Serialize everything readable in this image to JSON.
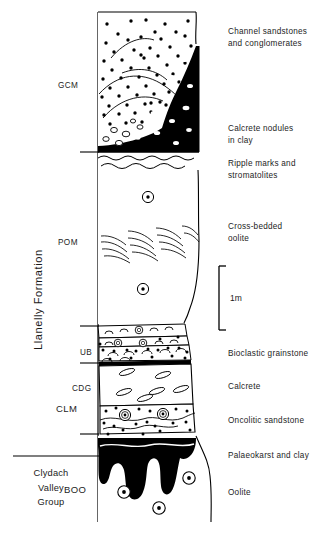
{
  "figure": {
    "type": "stratigraphic-column",
    "vertical_axis_label": "Llanelly Formation",
    "group_label": "Clydach\nValley\nGroup",
    "scale_bar": {
      "label": "1m",
      "top_y": 266,
      "bottom_y": 330
    },
    "members": [
      {
        "abbr": "GCM",
        "name": "Gilwern Clay Member"
      },
      {
        "abbr": "POM",
        "name": "Pwll-y-cwm Oolite Member"
      },
      {
        "abbr": "UB",
        "name": "Unnamed Bed"
      },
      {
        "abbr": "CDG",
        "name": "Cheltenham Limestone / Dolomite"
      },
      {
        "abbr": "CLM",
        "name": "Clydach Limestone Member"
      },
      {
        "abbr": "BOO",
        "name": "Blaen Onneu Oolite"
      }
    ],
    "lithology_labels": [
      {
        "text": "Channel sandstones",
        "y": 27
      },
      {
        "text": "and conglomerates",
        "y": 39
      },
      {
        "text": "Calcrete nodules",
        "y": 124
      },
      {
        "text": "in clay",
        "y": 136
      },
      {
        "text": "Ripple marks and",
        "y": 159
      },
      {
        "text": "stromatolites",
        "y": 171
      },
      {
        "text": "Cross-bedded",
        "y": 222
      },
      {
        "text": "oolite",
        "y": 234
      },
      {
        "text": "Bioclastic grainstone",
        "y": 350
      },
      {
        "text": "Calcrete",
        "y": 383
      },
      {
        "text": "Oncolitic sandstone",
        "y": 417
      },
      {
        "text": "Palaeokarst and clay",
        "y": 452
      },
      {
        "text": "Oolite",
        "y": 489
      }
    ],
    "member_label_positions": [
      {
        "abbr": "GCM",
        "x": 58,
        "y": 80
      },
      {
        "abbr": "POM",
        "x": 58,
        "y": 237
      },
      {
        "abbr": "UB",
        "x": 78,
        "y": 350
      },
      {
        "abbr": "CDG",
        "x": 72,
        "y": 385
      },
      {
        "abbr": "CLM",
        "x": 58,
        "y": 404
      },
      {
        "abbr": "BOO",
        "x": 62,
        "y": 486
      }
    ],
    "colors": {
      "ink": "#000000",
      "text": "#1d1d1d",
      "background": "#ffffff",
      "fill_black": "#000000",
      "fill_white": "#ffffff"
    },
    "column_geometry": {
      "left_x": 98,
      "right_x": 198,
      "top_y": 12,
      "bottom_y": 522
    }
  }
}
